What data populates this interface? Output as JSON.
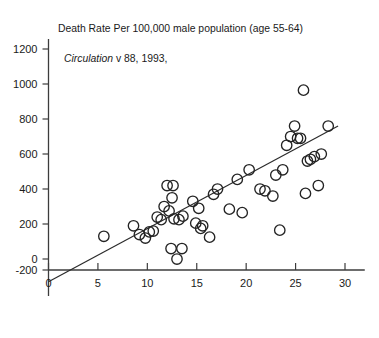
{
  "chart_data": {
    "type": "scatter",
    "title": "Death Rate Per 100,000 male population (age 55-64)",
    "source_italic": "Circulation",
    "source_rest": " v 88, 1993,",
    "xlabel": "",
    "ylabel": "",
    "xlim": [
      0,
      32
    ],
    "ylim": [
      -200,
      1200
    ],
    "xticks": [
      0,
      5,
      10,
      15,
      20,
      25,
      30
    ],
    "yticks": [
      -200,
      0,
      200,
      400,
      600,
      800,
      1000,
      1200
    ],
    "grid": false,
    "legend": "none",
    "point_marker": "open-circle",
    "trendline": {
      "label": "least-squares fit",
      "x_start": 0,
      "y_start": -130,
      "x_end": 29.3,
      "y_end": 760
    },
    "points": [
      {
        "x": 5.6,
        "y": 130
      },
      {
        "x": 8.6,
        "y": 190
      },
      {
        "x": 9.2,
        "y": 140
      },
      {
        "x": 9.8,
        "y": 120
      },
      {
        "x": 10.2,
        "y": 155
      },
      {
        "x": 10.6,
        "y": 160
      },
      {
        "x": 11.0,
        "y": 240
      },
      {
        "x": 11.4,
        "y": 225
      },
      {
        "x": 11.7,
        "y": 300
      },
      {
        "x": 12.0,
        "y": 420
      },
      {
        "x": 12.2,
        "y": 275
      },
      {
        "x": 12.4,
        "y": 60
      },
      {
        "x": 12.5,
        "y": 350
      },
      {
        "x": 12.6,
        "y": 420
      },
      {
        "x": 12.7,
        "y": 230
      },
      {
        "x": 13.0,
        "y": 0
      },
      {
        "x": 13.2,
        "y": 225
      },
      {
        "x": 13.5,
        "y": 60
      },
      {
        "x": 13.6,
        "y": 245
      },
      {
        "x": 14.6,
        "y": 330
      },
      {
        "x": 14.9,
        "y": 205
      },
      {
        "x": 15.2,
        "y": 290
      },
      {
        "x": 15.4,
        "y": 175
      },
      {
        "x": 15.6,
        "y": 190
      },
      {
        "x": 16.3,
        "y": 125
      },
      {
        "x": 16.7,
        "y": 370
      },
      {
        "x": 17.1,
        "y": 400
      },
      {
        "x": 18.3,
        "y": 285
      },
      {
        "x": 19.1,
        "y": 455
      },
      {
        "x": 19.6,
        "y": 265
      },
      {
        "x": 20.3,
        "y": 510
      },
      {
        "x": 21.4,
        "y": 400
      },
      {
        "x": 21.9,
        "y": 390
      },
      {
        "x": 22.7,
        "y": 360
      },
      {
        "x": 23.0,
        "y": 480
      },
      {
        "x": 23.4,
        "y": 165
      },
      {
        "x": 23.7,
        "y": 510
      },
      {
        "x": 24.1,
        "y": 650
      },
      {
        "x": 24.5,
        "y": 700
      },
      {
        "x": 24.9,
        "y": 760
      },
      {
        "x": 25.2,
        "y": 690
      },
      {
        "x": 25.5,
        "y": 690
      },
      {
        "x": 25.8,
        "y": 965
      },
      {
        "x": 26.0,
        "y": 375
      },
      {
        "x": 26.2,
        "y": 560
      },
      {
        "x": 26.5,
        "y": 570
      },
      {
        "x": 26.9,
        "y": 585
      },
      {
        "x": 27.3,
        "y": 420
      },
      {
        "x": 27.6,
        "y": 600
      },
      {
        "x": 28.3,
        "y": 760
      }
    ]
  }
}
